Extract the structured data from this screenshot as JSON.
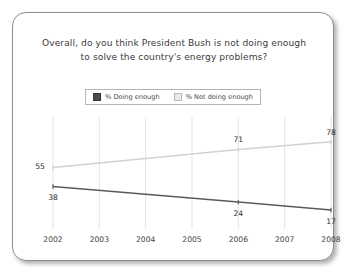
{
  "card": {
    "title_line_1": "Overall, do you think President Bush is not doing enough",
    "title_line_2": "to solve the country's energy problems?"
  },
  "legend": {
    "items": [
      {
        "label": "% Doing enough",
        "swatch": "dark-swatch-icon",
        "color": "#4a4a4a"
      },
      {
        "label": "% Not doing enough",
        "swatch": "light-swatch-icon",
        "color": "#e9e9e9"
      }
    ]
  },
  "chart_data": {
    "type": "line",
    "title": "Overall, do you think President Bush is not doing enough to solve the country's energy problems?",
    "xlabel": "",
    "ylabel": "",
    "x": [
      2002,
      2003,
      2004,
      2005,
      2006,
      2007,
      2008
    ],
    "categories": [
      "2002",
      "2003",
      "2004",
      "2005",
      "2006",
      "2007",
      "2008"
    ],
    "ylim": [
      0,
      100
    ],
    "grid": "vertical",
    "legend_position": "top-center",
    "series": [
      {
        "name": "% Not doing enough",
        "color": "#d2d2d2",
        "points": [
          {
            "x": 2002,
            "y": 55,
            "label": "55",
            "label_pos": "left"
          },
          {
            "x": 2006,
            "y": 71,
            "label": "71",
            "label_pos": "above"
          },
          {
            "x": 2008,
            "y": 78,
            "label": "78",
            "label_pos": "above"
          }
        ]
      },
      {
        "name": "% Doing enough",
        "color": "#5a5a5a",
        "points": [
          {
            "x": 2002,
            "y": 38,
            "label": "38",
            "label_pos": "below"
          },
          {
            "x": 2006,
            "y": 24,
            "label": "24",
            "label_pos": "below"
          },
          {
            "x": 2008,
            "y": 17,
            "label": "17",
            "label_pos": "below"
          }
        ]
      }
    ]
  }
}
